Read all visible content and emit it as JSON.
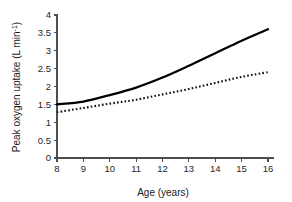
{
  "chart_data": {
    "type": "line",
    "title": "",
    "xlabel": "Age (years)",
    "ylabel": "Peak oxygen uptake (L min",
    "ylabel_superscript": "-1",
    "ylabel_suffix": ")",
    "xlim": [
      8,
      16
    ],
    "ylim": [
      0,
      4
    ],
    "grid": false,
    "legend": "none",
    "x_ticks": [
      8,
      9,
      10,
      11,
      12,
      13,
      14,
      15,
      16
    ],
    "x_tick_labels": [
      "8",
      "9",
      "10",
      "11",
      "12",
      "13",
      "14",
      "15",
      "16"
    ],
    "y_ticks": [
      0,
      0.5,
      1,
      1.5,
      2,
      2.5,
      3,
      3.5,
      4
    ],
    "y_tick_labels": [
      "0",
      "0.5",
      "1",
      "1.5",
      "2",
      "2.5",
      "3",
      "3.5",
      "4"
    ],
    "x": [
      8,
      9,
      10,
      11,
      12,
      13,
      14,
      15,
      16
    ],
    "series": [
      {
        "name": "boys",
        "style": "solid",
        "color": "#000000",
        "values": [
          1.5,
          1.58,
          1.76,
          1.97,
          2.25,
          2.58,
          2.93,
          3.28,
          3.6
        ]
      },
      {
        "name": "girls",
        "style": "dotted",
        "color": "#0d0d0d",
        "values": [
          1.28,
          1.4,
          1.52,
          1.63,
          1.78,
          1.93,
          2.1,
          2.27,
          2.4
        ]
      }
    ]
  },
  "axes_geometry": {
    "x_pixel_min": 57,
    "x_pixel_max": 268,
    "y_pixel_zero": 158,
    "y_pixel_max": 15
  }
}
